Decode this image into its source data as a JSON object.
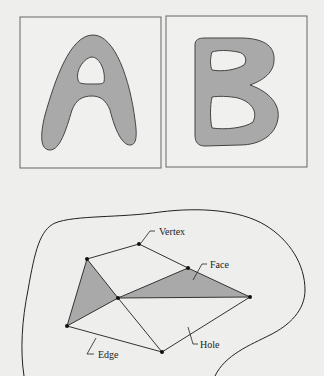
{
  "figure": {
    "top_panels": [
      {
        "letter": "A",
        "description": "Letter A shape with one hole"
      },
      {
        "letter": "B",
        "description": "Letter B shape with two holes"
      }
    ],
    "mesh_labels": {
      "vertex": "Vertex",
      "face": "Face",
      "edge": "Edge",
      "hole": "Hole"
    },
    "colors": {
      "fill": "#a9a9a9",
      "stroke": "#333333",
      "background": "#eeeeec"
    }
  }
}
